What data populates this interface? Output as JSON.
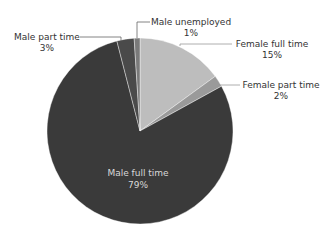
{
  "chart_data": {
    "type": "pie",
    "title": "",
    "categories": [
      "Female full time",
      "Female part time",
      "Male full time",
      "Male part time",
      "Male unemployed"
    ],
    "values": [
      15,
      2,
      79,
      3,
      1
    ],
    "value_labels": [
      "15%",
      "2%",
      "79%",
      "3%",
      "1%"
    ],
    "colors": [
      "#bdbdbd",
      "#9a9a9a",
      "#3a3a3a",
      "#4a4a4a",
      "#7a7a7a"
    ],
    "start_angle": "12 o'clock",
    "direction": "clockwise",
    "legend": "none (data labels with leader lines)"
  },
  "labels": {
    "male_unemployed": {
      "name": "Male unemployed",
      "pct": "1%"
    },
    "female_full_time": {
      "name": "Female full time",
      "pct": "15%"
    },
    "female_part_time": {
      "name": "Female part time",
      "pct": "2%"
    },
    "male_part_time": {
      "name": "Male part time",
      "pct": "3%"
    },
    "male_full_time": {
      "name": "Male full time",
      "pct": "79%"
    }
  }
}
